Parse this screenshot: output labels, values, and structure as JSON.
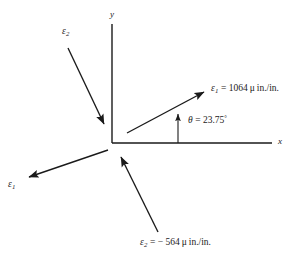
{
  "figure": {
    "type": "vector-diagram",
    "background_color": "#ffffff",
    "line_color": "#1a1a1a"
  },
  "axes": {
    "x_label": "x",
    "y_label": "y",
    "origin": {
      "x": 112,
      "y": 143
    },
    "x_axis_end": {
      "x": 272,
      "y": 143
    },
    "y_axis_top": {
      "x": 112,
      "y": 24
    }
  },
  "angle": {
    "symbol": "θ",
    "equals": "=",
    "value": "23.75",
    "degree": "°",
    "full_text": "θ = 23.75°",
    "measured_from": "x-axis",
    "degrees": 23.75
  },
  "vectors": [
    {
      "name": "epsilon-1-primary",
      "symbol": "ε",
      "subscript": "1",
      "label_text": "ε₁ = 1064 μ in./in.",
      "equals": "=",
      "value": "1064",
      "unit": "μ in./in.",
      "direction_degrees": 23.75,
      "start": {
        "x": 127,
        "y": 133
      },
      "end": {
        "x": 206,
        "y": 91
      }
    },
    {
      "name": "epsilon-1-opposite",
      "symbol": "ε",
      "subscript": "1",
      "label_text": "ε₁",
      "direction_degrees": 203.75,
      "start": {
        "x": 108,
        "y": 150
      },
      "end": {
        "x": 26,
        "y": 178
      }
    },
    {
      "name": "epsilon-2-primary",
      "symbol": "ε",
      "subscript": "2",
      "label_text": "ε₂ = − 564 μ in./in.",
      "equals": "=",
      "value": "− 564",
      "unit": "μ in./in.",
      "direction_degrees": 113.75,
      "start": {
        "x": 158,
        "y": 232
      },
      "end": {
        "x": 120,
        "y": 155
      }
    },
    {
      "name": "epsilon-2-opposite",
      "symbol": "ε",
      "subscript": "2",
      "label_text": "ε₂",
      "direction_degrees": 293.75,
      "start": {
        "x": 68,
        "y": 48
      },
      "end": {
        "x": 105,
        "y": 126
      }
    }
  ],
  "labels": {
    "eps1_main": {
      "symbol": "ε",
      "sub": "1",
      "rest": "= 1064",
      "mu": "μ",
      "unit": "in./in."
    },
    "eps1_opposite": {
      "symbol": "ε",
      "sub": "1"
    },
    "eps2_main": {
      "symbol": "ε",
      "sub": "2",
      "rest": "= − 564",
      "mu": "μ",
      "unit": "in./in."
    },
    "eps2_opposite": {
      "symbol": "ε",
      "sub": "2"
    },
    "theta": {
      "symbol": "θ",
      "rest": "= 23.75",
      "degree": "°"
    }
  }
}
